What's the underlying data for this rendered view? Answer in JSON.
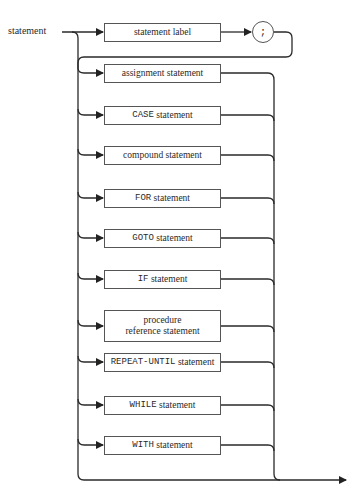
{
  "diagram": {
    "title": "statement",
    "entry_label": "statement",
    "optional_prefix": {
      "box": "statement label",
      "terminal": ";"
    },
    "alternatives": [
      {
        "id": "assignment",
        "keyword": "",
        "text": "assignment statement"
      },
      {
        "id": "case",
        "keyword": "CASE",
        "text": " statement"
      },
      {
        "id": "compound",
        "keyword": "",
        "text": "compound statement"
      },
      {
        "id": "for",
        "keyword": "FOR",
        "text": " statement"
      },
      {
        "id": "goto",
        "keyword": "GOTO",
        "text": " statement"
      },
      {
        "id": "if",
        "keyword": "IF",
        "text": " statement"
      },
      {
        "id": "procedure-reference",
        "keyword": "",
        "text": "procedure",
        "text2": "reference statement"
      },
      {
        "id": "repeat-until",
        "keyword": "REPEAT-UNTIL",
        "text": " statement"
      },
      {
        "id": "while",
        "keyword": "WHILE",
        "text": " statement"
      },
      {
        "id": "with",
        "keyword": "WITH",
        "text": " statement"
      }
    ],
    "empty_path": true,
    "colors": {
      "line": "#2a2a2a",
      "box_border": "#555555",
      "background": "#ffffff"
    }
  }
}
